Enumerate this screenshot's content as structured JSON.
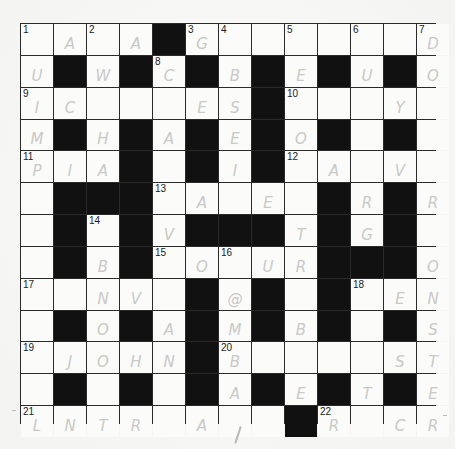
{
  "puzzle": {
    "rows": 13,
    "cols": 13,
    "layout": [
      "....#........",
      ".#.#.#.#.#.#.",
      ".......#.....",
      ".#.#.#.#.#.#.",
      "...#.#.#.....",
      ".###.....#.#.",
      ".#.#.###.#.#.",
      ".#.#.....###.",
      ".....#.#.#...",
      ".#.#.#.#.#.#.",
      ".....#.......",
      ".#.#.#.#.#.#.",
      "........#...."
    ],
    "numbers": [
      {
        "r": 0,
        "c": 0,
        "n": "1"
      },
      {
        "r": 0,
        "c": 2,
        "n": "2"
      },
      {
        "r": 0,
        "c": 5,
        "n": "3"
      },
      {
        "r": 0,
        "c": 6,
        "n": "4"
      },
      {
        "r": 0,
        "c": 8,
        "n": "5"
      },
      {
        "r": 0,
        "c": 10,
        "n": "6"
      },
      {
        "r": 0,
        "c": 12,
        "n": "7"
      },
      {
        "r": 1,
        "c": 4,
        "n": "8"
      },
      {
        "r": 2,
        "c": 0,
        "n": "9"
      },
      {
        "r": 2,
        "c": 8,
        "n": "10"
      },
      {
        "r": 4,
        "c": 0,
        "n": "11"
      },
      {
        "r": 4,
        "c": 8,
        "n": "12"
      },
      {
        "r": 5,
        "c": 4,
        "n": "13"
      },
      {
        "r": 6,
        "c": 2,
        "n": "14"
      },
      {
        "r": 7,
        "c": 4,
        "n": "15"
      },
      {
        "r": 7,
        "c": 6,
        "n": "16"
      },
      {
        "r": 8,
        "c": 0,
        "n": "17"
      },
      {
        "r": 8,
        "c": 10,
        "n": "18"
      },
      {
        "r": 10,
        "c": 0,
        "n": "19"
      },
      {
        "r": 10,
        "c": 6,
        "n": "20"
      },
      {
        "r": 12,
        "c": 0,
        "n": "21"
      },
      {
        "r": 12,
        "c": 9,
        "n": "22"
      }
    ],
    "pencil_letters": [
      {
        "r": 0,
        "c": 1,
        "ch": "A"
      },
      {
        "r": 0,
        "c": 3,
        "ch": "A"
      },
      {
        "r": 0,
        "c": 5,
        "ch": "G"
      },
      {
        "r": 0,
        "c": 12,
        "ch": "D"
      },
      {
        "r": 1,
        "c": 0,
        "ch": "U"
      },
      {
        "r": 1,
        "c": 2,
        "ch": "W"
      },
      {
        "r": 1,
        "c": 4,
        "ch": "C"
      },
      {
        "r": 1,
        "c": 6,
        "ch": "B"
      },
      {
        "r": 1,
        "c": 8,
        "ch": "E"
      },
      {
        "r": 1,
        "c": 10,
        "ch": "U"
      },
      {
        "r": 1,
        "c": 12,
        "ch": "O"
      },
      {
        "r": 2,
        "c": 0,
        "ch": "I"
      },
      {
        "r": 2,
        "c": 1,
        "ch": "C"
      },
      {
        "r": 2,
        "c": 5,
        "ch": "E"
      },
      {
        "r": 2,
        "c": 6,
        "ch": "S"
      },
      {
        "r": 2,
        "c": 11,
        "ch": "Y"
      },
      {
        "r": 3,
        "c": 0,
        "ch": "M"
      },
      {
        "r": 3,
        "c": 2,
        "ch": "H"
      },
      {
        "r": 3,
        "c": 4,
        "ch": "A"
      },
      {
        "r": 3,
        "c": 6,
        "ch": "E"
      },
      {
        "r": 3,
        "c": 8,
        "ch": "O"
      },
      {
        "r": 4,
        "c": 0,
        "ch": "P"
      },
      {
        "r": 4,
        "c": 1,
        "ch": "I"
      },
      {
        "r": 4,
        "c": 2,
        "ch": "A"
      },
      {
        "r": 4,
        "c": 6,
        "ch": "I"
      },
      {
        "r": 4,
        "c": 9,
        "ch": "A"
      },
      {
        "r": 4,
        "c": 11,
        "ch": "V"
      },
      {
        "r": 5,
        "c": 5,
        "ch": "A"
      },
      {
        "r": 5,
        "c": 7,
        "ch": "E"
      },
      {
        "r": 5,
        "c": 10,
        "ch": "R"
      },
      {
        "r": 5,
        "c": 12,
        "ch": "R"
      },
      {
        "r": 6,
        "c": 4,
        "ch": "V"
      },
      {
        "r": 6,
        "c": 8,
        "ch": "T"
      },
      {
        "r": 6,
        "c": 10,
        "ch": "G"
      },
      {
        "r": 7,
        "c": 2,
        "ch": "B"
      },
      {
        "r": 7,
        "c": 5,
        "ch": "O"
      },
      {
        "r": 7,
        "c": 7,
        "ch": "U"
      },
      {
        "r": 7,
        "c": 8,
        "ch": "R"
      },
      {
        "r": 7,
        "c": 12,
        "ch": "O"
      },
      {
        "r": 8,
        "c": 2,
        "ch": "N"
      },
      {
        "r": 8,
        "c": 3,
        "ch": "V"
      },
      {
        "r": 8,
        "c": 6,
        "ch": "@"
      },
      {
        "r": 8,
        "c": 11,
        "ch": "E"
      },
      {
        "r": 8,
        "c": 12,
        "ch": "N"
      },
      {
        "r": 9,
        "c": 2,
        "ch": "O"
      },
      {
        "r": 9,
        "c": 4,
        "ch": "A"
      },
      {
        "r": 9,
        "c": 6,
        "ch": "M"
      },
      {
        "r": 9,
        "c": 8,
        "ch": "B"
      },
      {
        "r": 9,
        "c": 12,
        "ch": "S"
      },
      {
        "r": 10,
        "c": 1,
        "ch": "J"
      },
      {
        "r": 10,
        "c": 2,
        "ch": "O"
      },
      {
        "r": 10,
        "c": 3,
        "ch": "H"
      },
      {
        "r": 10,
        "c": 4,
        "ch": "N"
      },
      {
        "r": 10,
        "c": 6,
        "ch": "B"
      },
      {
        "r": 10,
        "c": 11,
        "ch": "S"
      },
      {
        "r": 10,
        "c": 12,
        "ch": "T"
      },
      {
        "r": 11,
        "c": 6,
        "ch": "A"
      },
      {
        "r": 11,
        "c": 8,
        "ch": "E"
      },
      {
        "r": 11,
        "c": 10,
        "ch": "T"
      },
      {
        "r": 11,
        "c": 12,
        "ch": "E"
      },
      {
        "r": 12,
        "c": 0,
        "ch": "L"
      },
      {
        "r": 12,
        "c": 1,
        "ch": "N"
      },
      {
        "r": 12,
        "c": 2,
        "ch": "T"
      },
      {
        "r": 12,
        "c": 3,
        "ch": "R"
      },
      {
        "r": 12,
        "c": 5,
        "ch": "A"
      },
      {
        "r": 12,
        "c": 9,
        "ch": "R"
      },
      {
        "r": 12,
        "c": 11,
        "ch": "C"
      },
      {
        "r": 12,
        "c": 12,
        "ch": "R"
      }
    ]
  }
}
